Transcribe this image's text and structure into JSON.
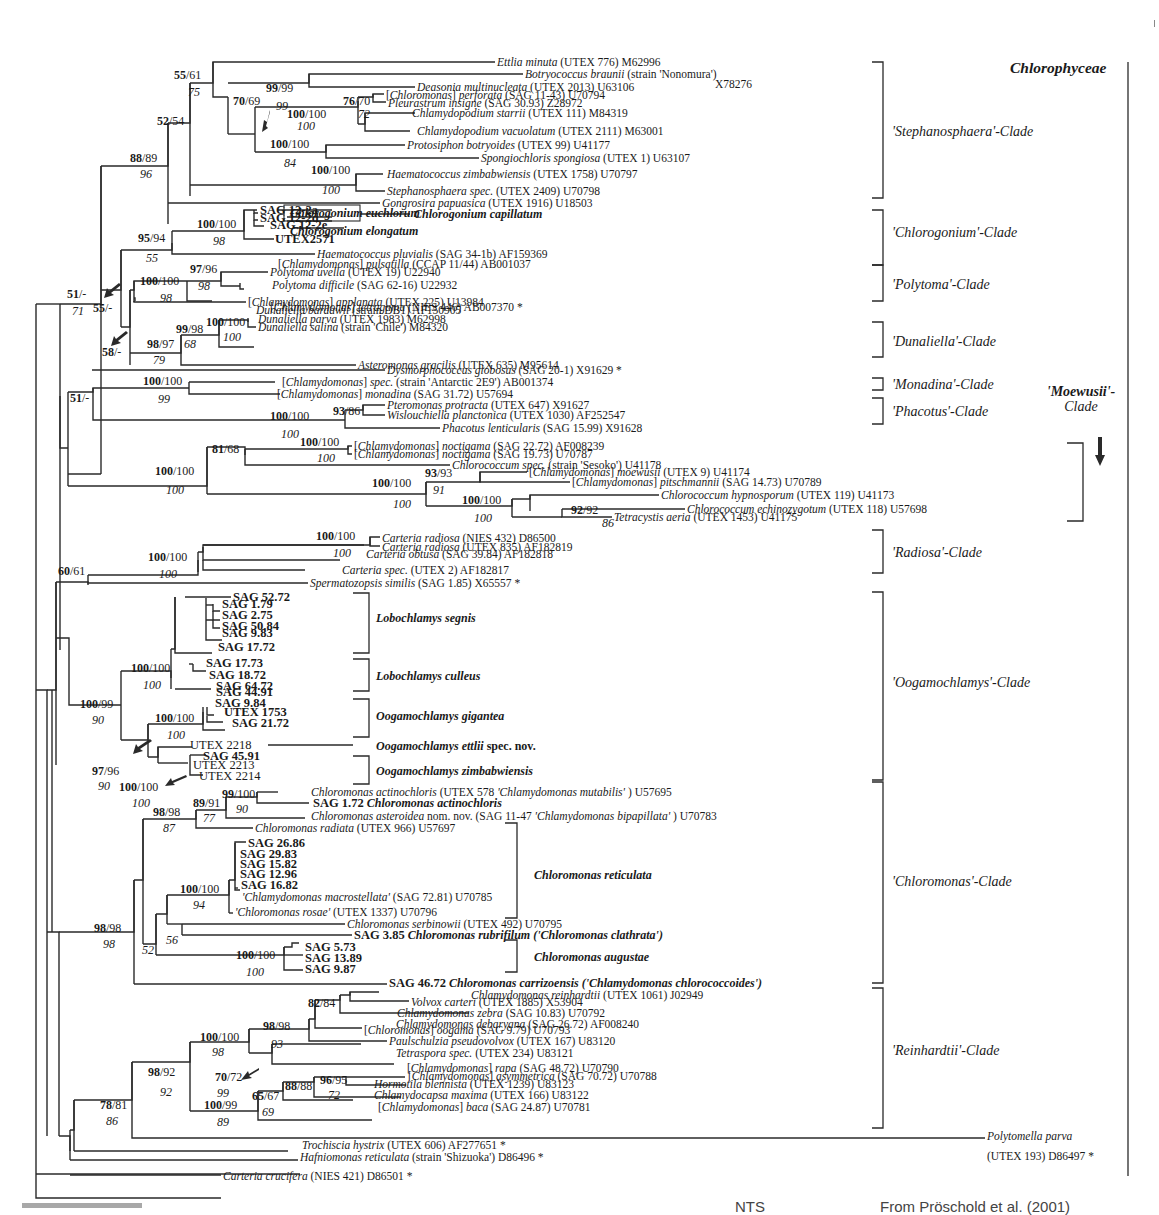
{
  "figure": {
    "type": "phylogenetic-tree",
    "group_label": "Chlorophyceae",
    "footer_citation": "From Pröschold et al. (2001)",
    "footer_mid": "NTS"
  },
  "clades": [
    {
      "id": "stephanosphaera",
      "label": "'Stephanosphaera'-Clade"
    },
    {
      "id": "chlorogonium",
      "label": "'Chlorogonium'-Clade"
    },
    {
      "id": "polytoma",
      "label": "'Polytoma'-Clade"
    },
    {
      "id": "dunaliella",
      "label": "'Dunaliella'-Clade"
    },
    {
      "id": "monadina",
      "label": "'Monadina'-Clade"
    },
    {
      "id": "phacotus",
      "label": "'Phacotus'-Clade"
    },
    {
      "id": "moewusii",
      "label": "'Moewusii'-",
      "label2": "Clade"
    },
    {
      "id": "radiosa",
      "label": "'Radiosa'-Clade"
    },
    {
      "id": "oogamochlamys",
      "label": "'Oogamochlamys'-Clade"
    },
    {
      "id": "chloromonas",
      "label": "'Chloromonas'-Clade"
    },
    {
      "id": "reinhardtii",
      "label": "'Reinhardtii'-Clade"
    }
  ],
  "species_groups": {
    "chlorogonium_euchlorum": "Chlorogonium euchlorum",
    "chlorogonium_capillatum": "Chlorogonium capillatum",
    "chlorogonium_elongatum": "Chlorogonium elongatum",
    "lobochlamys_segnis": "Lobochlamys segnis",
    "lobochlamys_culleus": "Lobochlamys culleus",
    "oogamochlamys_gigantea": "Oogamochlamys gigantea",
    "oogamochlamys_ettlii": "Oogamochlamys ettlii",
    "oogamochlamys_ettlii_suffix": " spec. nov.",
    "oogamochlamys_zimbabwiensis": "Oogamochlamys zimbabwiensis",
    "chloromonas_reticulata": "Chloromonas reticulata",
    "chloromonas_augustae": "Chloromonas augustae"
  },
  "taxa": [
    {
      "it": "Ettlia minuta",
      "rest": " (UTEX 776) M62996"
    },
    {
      "it": "Botryococcus braunii",
      "rest": " (strain 'Nonomura')",
      "extra": "X78276"
    },
    {
      "it": "Deasonia multinucleata",
      "rest": " (UTEX 2013) U63106"
    },
    {
      "pre": "[",
      "it": "Chloromonas",
      "mid": "] ",
      "it2": "perforata",
      "rest": " (SAG 11-43) U70794"
    },
    {
      "it": "Pleurastrum insigne",
      "rest": " (SAG 30.93) Z28972"
    },
    {
      "it": "Chlamydopodium starrii",
      "rest": " (UTEX 111) M84319"
    },
    {
      "it": "Chlamydopodium vacuolatum",
      "rest": " (UTEX 2111) M63001"
    },
    {
      "it": "Protosiphon botryoides",
      "rest": " (UTEX 99) U41177"
    },
    {
      "it": "Spongiochloris spongiosa",
      "rest": " (UTEX 1) U63107"
    },
    {
      "it": "Haematococcus zimbabwiensis",
      "rest": " (UTEX 1758) U70797"
    },
    {
      "it": "Stephanosphaera spec.",
      "rest": " (UTEX 2409) U70798"
    },
    {
      "it": "Gongrosira papuasica",
      "rest": " (UTEX 1916) U18503"
    },
    {
      "bold": "SAG 12-2a"
    },
    {
      "bold": "SAG 12-2d"
    },
    {
      "bold": "SAG 12-2e"
    },
    {
      "bold": "UTEX2571"
    },
    {
      "it": "Haematococcus pluvialis",
      "rest": " (SAG 34-1b) AF159369"
    },
    {
      "pre": "[",
      "it": "Chlamydomonas",
      "mid": "] ",
      "it2": "pulsatilla",
      "rest": " (CCAP 11/44) AB001037"
    },
    {
      "it": "Polytoma uvella",
      "rest": " (UTEX 19) U22940"
    },
    {
      "it": "Polytoma difficile",
      "rest": " (SAG 62-16) U22932"
    },
    {
      "pre": "[",
      "it": "Chlamydomonas",
      "mid": "] ",
      "it2": "applanata",
      "rest": " (UTEX 225) U13984"
    },
    {
      "pre": "[",
      "it": "Chlamydomonas",
      "mid": "] ",
      "it2": "tetragama",
      "rest": " (NIES 446) AB007370 *"
    },
    {
      "it": "Dunaliella bardawil",
      "rest": " (strain DB1) AF150905"
    },
    {
      "it": "Dunaliella parva",
      "rest": " (UTEX 1983) M62998"
    },
    {
      "it": "Dunaliella salina",
      "rest": " (strain 'Chile') M84320"
    },
    {
      "it": "Asteromonas gracilis",
      "rest": " (UTEX 635) M95614"
    },
    {
      "it": "Dysmorphococcus globosus",
      "rest": " (SAG 20-1) X91629 *"
    },
    {
      "pre": "[",
      "it": "Chlamydomonas",
      "mid": "] ",
      "it2": "spec.",
      "rest": " (strain 'Antarctic 2E9') AB001374"
    },
    {
      "pre": "[",
      "it": "Chlamydomonas",
      "mid": "] ",
      "it2": "monadina",
      "rest": " (SAG 31.72) U57694"
    },
    {
      "it": "Pteromonas protracta",
      "rest": " (UTEX 647) X91627"
    },
    {
      "it": "Wislouchiella planctonica",
      "rest": " (UTEX 1030) AF252547"
    },
    {
      "it": "Phacotus lenticularis",
      "rest": " (SAG 15.99) X91628"
    },
    {
      "pre": "[",
      "it": "Chlamydomonas",
      "mid": "] ",
      "it2": "noctigama",
      "rest": " (SAG 22.72) AF008239"
    },
    {
      "pre": "[",
      "it": "Chlamydomonas",
      "mid": "] ",
      "it2": "noctigama",
      "rest": " (SAG 19.73) U70787"
    },
    {
      "it": "Chlorococcum spec.",
      "rest": " (strain 'Sesoko') U41178"
    },
    {
      "pre": "[",
      "it": "Chlamydomonas",
      "mid": "] ",
      "it2": "moewusii",
      "rest": " (UTEX 9) U41174"
    },
    {
      "pre": "[",
      "it": "Chlamydomonas",
      "mid": "] ",
      "it2": "pitschmannii",
      "rest": " (SAG 14.73) U70789"
    },
    {
      "it": "Chlorococcum hypnosporum",
      "rest": " (UTEX 119) U41173"
    },
    {
      "it": "Chlorococcum echinozygotum",
      "rest": " (UTEX 118) U57698"
    },
    {
      "it": "Tetracystis aeria",
      "rest": " (UTEX 1453) U41175"
    },
    {
      "it": "Carteria radiosa",
      "rest": " (NIES 432) D86500"
    },
    {
      "it": "Carteria radiosa",
      "rest": " (UTEX 835) AF182819"
    },
    {
      "it": "Carteria obtusa",
      "rest": " (SAG 39.84) AF182818"
    },
    {
      "it": "Carteria spec.",
      "rest": " (UTEX 2) AF182817"
    },
    {
      "it": "Spermatozopsis similis",
      "rest": " (SAG 1.85) X65557 *"
    },
    {
      "bold": "SAG 52.72"
    },
    {
      "bold": "SAG 1.79"
    },
    {
      "bold": "SAG 2.75"
    },
    {
      "bold": "SAG 50.84"
    },
    {
      "bold": "SAG 9.83"
    },
    {
      "bold": "SAG 17.72"
    },
    {
      "bold": "SAG 17.73"
    },
    {
      "bold": "SAG 18.72"
    },
    {
      "bold": "SAG 64.72"
    },
    {
      "bold": "SAG 44.91"
    },
    {
      "bold": "SAG 9.84"
    },
    {
      "bold": "UTEX 1753"
    },
    {
      "bold": "SAG 21.72"
    },
    {
      "plain": "UTEX 2218"
    },
    {
      "bold": "SAG 45.91"
    },
    {
      "plain": "UTEX 2213"
    },
    {
      "plain": "UTEX 2214"
    },
    {
      "it": "Chloromonas actinochloris",
      "rest": " (UTEX 578 ",
      "it2": "'Chlamydomonas mutabilis'",
      "rest2": " ) U57695"
    },
    {
      "bold": "SAG 1.72 ",
      "bi": "Chloromonas actinochloris"
    },
    {
      "it": "Chloromonas asteroidea",
      "rest": " nom. nov. (SAG 11-47 ",
      "it2": "'Chlamydomonas bipapillata'",
      "rest2": " ) U70783"
    },
    {
      "it": "Chloromonas radiata",
      "rest": " (UTEX 966) U57697"
    },
    {
      "bold": "SAG 26.86"
    },
    {
      "bold": "SAG 29.83"
    },
    {
      "bold": "SAG 15.82"
    },
    {
      "bold": "SAG 12.96"
    },
    {
      "bold": "SAG 16.82"
    },
    {
      "it": "'Chlamydomonas macrostellata'",
      "rest": " (SAG 72.81) U70785"
    },
    {
      "it": "'Chloromonas rosae'",
      "rest": " (UTEX 1337) U70796"
    },
    {
      "it": "Chloromonas serbinowii",
      "rest": " (UTEX 492) U70795"
    },
    {
      "bold": "SAG 3.85 ",
      "bi": "Chloromonas rubrifilum ('Chloromonas clathrata')"
    },
    {
      "bold": "SAG 5.73"
    },
    {
      "bold": "SAG 13.89"
    },
    {
      "bold": "SAG 9.87"
    },
    {
      "bold": "SAG 46.72 ",
      "bi": "Chloromonas carrizoensis ('Chlamydomonas chlorococcoides')"
    },
    {
      "it": "Chlamydomonas reinhardtii",
      "rest": " (UTEX 1061) J02949"
    },
    {
      "it": "Volvox carteri",
      "rest": " (UTEX 1885) X53904"
    },
    {
      "it": "Chlamydomonas zebra",
      "rest": " (SAG 10.83) U70792"
    },
    {
      "it": "Chlamydomonas debaryana",
      "rest": " (SAG 26.72) AF008240"
    },
    {
      "pre": "[",
      "it": "Chloromonas",
      "mid": "] ",
      "it2": "oogama",
      "rest": " (SAG 9.79) U70793"
    },
    {
      "it": "Paulschulzia pseudovolvox",
      "rest": " (UTEX 167) U83120"
    },
    {
      "it": "Tetraspora spec.",
      "rest": " (UTEX 234) U83121"
    },
    {
      "pre": "[",
      "it": "Chlamydomonas",
      "mid": "] ",
      "it2": "rapa",
      "rest": " (SAG 48.72) U70790"
    },
    {
      "pre": "[",
      "it": "Chlamydomonas",
      "mid": "] ",
      "it2": "asymmetrica",
      "rest": " (SAG 70.72) U70788"
    },
    {
      "it": "Hormotila blennista",
      "rest": " (UTEX 1239) U83123"
    },
    {
      "it": "Chlamydocapsa maxima",
      "rest": " (UTEX 166) U83122"
    },
    {
      "pre": "[",
      "it": "Chlamydomonas",
      "mid": "] ",
      "it2": "baca",
      "rest": " (SAG 24.87) U70781"
    },
    {
      "it": "Polytomella parva",
      "rest": "",
      "line2": "(UTEX 193) D86497 *"
    },
    {
      "it": "Trochiscia hystrix",
      "rest": " (UTEX 606) AF277651 *"
    },
    {
      "it": "Hafniomonas reticulata",
      "rest": " (strain 'Shizuoka') D86496 *"
    },
    {
      "it": "Carteria crucifera",
      "rest": " (NIES 421) D86501 *"
    }
  ],
  "supports": [
    {
      "b": "55",
      "r": "/61",
      "x": 174,
      "y": 69
    },
    {
      "it": "75",
      "x": 188,
      "y": 86
    },
    {
      "b": "99",
      "r": "/99",
      "x": 266,
      "y": 82
    },
    {
      "it": "99",
      "x": 276,
      "y": 100
    },
    {
      "b": "70",
      "r": "/69",
      "x": 233,
      "y": 95
    },
    {
      "b": "76",
      "r": "/70",
      "x": 343,
      "y": 95
    },
    {
      "it": "72",
      "x": 358,
      "y": 108
    },
    {
      "b": "100",
      "r": "/100",
      "x": 287,
      "y": 108
    },
    {
      "it": "100",
      "x": 297,
      "y": 120
    },
    {
      "b": "52",
      "r": "/54",
      "x": 157,
      "y": 115
    },
    {
      "b": "100",
      "r": "/100",
      "x": 270,
      "y": 138
    },
    {
      "it": "84",
      "x": 284,
      "y": 157
    },
    {
      "b": "88",
      "r": "/89",
      "x": 130,
      "y": 152
    },
    {
      "it": "96",
      "x": 140,
      "y": 168
    },
    {
      "b": "100",
      "r": "/100",
      "x": 311,
      "y": 164
    },
    {
      "it": "100",
      "x": 322,
      "y": 184
    },
    {
      "b": "100",
      "r": "/100",
      "x": 197,
      "y": 218
    },
    {
      "it": "98",
      "x": 213,
      "y": 235
    },
    {
      "b": "95",
      "r": "/94",
      "x": 138,
      "y": 232
    },
    {
      "it": "55",
      "x": 146,
      "y": 252
    },
    {
      "b": "97",
      "r": "/96",
      "x": 190,
      "y": 263
    },
    {
      "it": "98",
      "x": 198,
      "y": 280
    },
    {
      "b": "100",
      "r": "/100",
      "x": 140,
      "y": 275
    },
    {
      "it": "98",
      "x": 160,
      "y": 292
    },
    {
      "b": "51",
      "r": "/-",
      "x": 67,
      "y": 288
    },
    {
      "it": "71",
      "x": 72,
      "y": 305
    },
    {
      "b": "55",
      "r": "/-",
      "x": 93,
      "y": 302
    },
    {
      "b": "99",
      "r": "/98",
      "x": 176,
      "y": 323
    },
    {
      "it": "68",
      "x": 184,
      "y": 338
    },
    {
      "b": "100",
      "r": "/100",
      "x": 206,
      "y": 316
    },
    {
      "it": "100",
      "x": 223,
      "y": 331
    },
    {
      "b": "98",
      "r": "/97",
      "x": 147,
      "y": 338
    },
    {
      "it": "79",
      "x": 153,
      "y": 354
    },
    {
      "b": "58",
      "r": "/-",
      "x": 102,
      "y": 346
    },
    {
      "b": "100",
      "r": "/100",
      "x": 143,
      "y": 375
    },
    {
      "it": "99",
      "x": 158,
      "y": 393
    },
    {
      "b": "51",
      "r": "/-",
      "x": 70,
      "y": 392
    },
    {
      "b": "93",
      "r": "/86",
      "x": 333,
      "y": 405
    },
    {
      "b": "100",
      "r": "/100",
      "x": 270,
      "y": 410
    },
    {
      "it": "100",
      "x": 281,
      "y": 428
    },
    {
      "b": "100",
      "r": "/100",
      "x": 300,
      "y": 436
    },
    {
      "it": "100",
      "x": 317,
      "y": 452
    },
    {
      "b": "81",
      "r": "/68",
      "x": 212,
      "y": 443
    },
    {
      "b": "100",
      "r": "/100",
      "x": 155,
      "y": 465
    },
    {
      "it": "100",
      "x": 166,
      "y": 484
    },
    {
      "b": "93",
      "r": "/93",
      "x": 425,
      "y": 467
    },
    {
      "it": "91",
      "x": 433,
      "y": 484
    },
    {
      "b": "100",
      "r": "/100",
      "x": 372,
      "y": 477
    },
    {
      "it": "100",
      "x": 393,
      "y": 498
    },
    {
      "b": "100",
      "r": "/100",
      "x": 462,
      "y": 494
    },
    {
      "it": "100",
      "x": 474,
      "y": 512
    },
    {
      "b": "92",
      "r": "/92",
      "x": 571,
      "y": 504
    },
    {
      "it": "86",
      "x": 602,
      "y": 517
    },
    {
      "b": "100",
      "r": "/100",
      "x": 316,
      "y": 530
    },
    {
      "it": "100",
      "x": 333,
      "y": 547
    },
    {
      "b": "100",
      "r": "/100",
      "x": 148,
      "y": 551
    },
    {
      "it": "100",
      "x": 159,
      "y": 568
    },
    {
      "b": "60",
      "r": "/61",
      "x": 58,
      "y": 565
    },
    {
      "b": "100",
      "r": "/100",
      "x": 131,
      "y": 662
    },
    {
      "it": "100",
      "x": 143,
      "y": 679
    },
    {
      "b": "100",
      "r": "/99",
      "x": 80,
      "y": 698
    },
    {
      "it": "90",
      "x": 92,
      "y": 714
    },
    {
      "b": "100",
      "r": "/100",
      "x": 155,
      "y": 712
    },
    {
      "it": "100",
      "x": 167,
      "y": 729
    },
    {
      "b": "97",
      "r": "/96",
      "x": 92,
      "y": 765
    },
    {
      "it": "90",
      "x": 98,
      "y": 780
    },
    {
      "b": "100",
      "r": "/100",
      "x": 119,
      "y": 781
    },
    {
      "it": "100",
      "x": 132,
      "y": 797
    },
    {
      "b": "99",
      "r": "/100",
      "x": 222,
      "y": 788
    },
    {
      "it": "90",
      "x": 236,
      "y": 803
    },
    {
      "b": "89",
      "r": "/91",
      "x": 193,
      "y": 797
    },
    {
      "it": "77",
      "x": 203,
      "y": 812
    },
    {
      "b": "98",
      "r": "/98",
      "x": 153,
      "y": 806
    },
    {
      "it": "87",
      "x": 163,
      "y": 822
    },
    {
      "b": "100",
      "r": "/100",
      "x": 180,
      "y": 883
    },
    {
      "it": "94",
      "x": 193,
      "y": 899
    },
    {
      "b": "98",
      "r": "/98",
      "x": 94,
      "y": 922
    },
    {
      "it": "98",
      "x": 103,
      "y": 938
    },
    {
      "it": "52",
      "x": 142,
      "y": 944
    },
    {
      "it": "56",
      "x": 166,
      "y": 934
    },
    {
      "b": "100",
      "r": "/100",
      "x": 236,
      "y": 949
    },
    {
      "it": "100",
      "x": 246,
      "y": 966
    },
    {
      "b": "82",
      "r": "/84",
      "x": 308,
      "y": 997
    },
    {
      "b": "98",
      "r": "/98",
      "x": 263,
      "y": 1020
    },
    {
      "it": "93",
      "x": 271,
      "y": 1038
    },
    {
      "b": "100",
      "r": "/100",
      "x": 200,
      "y": 1031
    },
    {
      "it": "98",
      "x": 212,
      "y": 1046
    },
    {
      "b": "98",
      "r": "/92",
      "x": 148,
      "y": 1066
    },
    {
      "it": "92",
      "x": 160,
      "y": 1086
    },
    {
      "b": "70",
      "r": "/72",
      "x": 215,
      "y": 1071
    },
    {
      "it": "99",
      "x": 217,
      "y": 1087
    },
    {
      "b": "96",
      "r": "/95",
      "x": 320,
      "y": 1074
    },
    {
      "it": "72",
      "x": 328,
      "y": 1089
    },
    {
      "b": "88",
      "r": "/88",
      "x": 285,
      "y": 1080
    },
    {
      "b": "65",
      "r": "/67",
      "x": 252,
      "y": 1090
    },
    {
      "it": "69",
      "x": 262,
      "y": 1106
    },
    {
      "b": "100",
      "r": "/99",
      "x": 204,
      "y": 1099
    },
    {
      "it": "89",
      "x": 217,
      "y": 1116
    },
    {
      "b": "78",
      "r": "/81",
      "x": 100,
      "y": 1099
    },
    {
      "it": "86",
      "x": 106,
      "y": 1115
    }
  ]
}
